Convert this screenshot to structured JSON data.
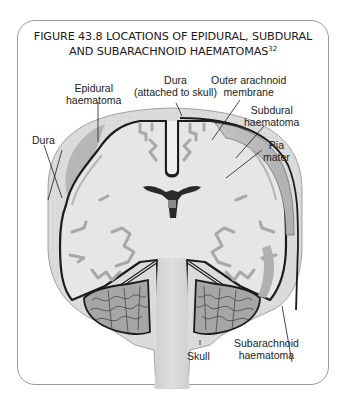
{
  "figure": {
    "title_line1": "FIGURE 43.8 LOCATIONS OF EPIDURAL, SUBDURAL",
    "title_line2": "AND SUBARACHNOID HAEMATOMAS",
    "title_reference": "32"
  },
  "diagram": {
    "labels": [
      {
        "id": "epidural-haematoma",
        "line1": "Epidural",
        "line2": "haematoma"
      },
      {
        "id": "dura-attached",
        "line1": "Dura",
        "line2": "(attached to skull)"
      },
      {
        "id": "outer-arachnoid",
        "line1": "Outer arachnoid",
        "line2": "membrane"
      },
      {
        "id": "dura",
        "line1": "Dura",
        "line2": ""
      },
      {
        "id": "subdural-haematoma",
        "line1": "Subdural",
        "line2": "haematoma"
      },
      {
        "id": "pia-mater",
        "line1": "Pia",
        "line2": "mater"
      },
      {
        "id": "subarachnoid-haematoma",
        "line1": "Subarachnoid",
        "line2": "haematoma"
      },
      {
        "id": "skull",
        "line1": "Skull",
        "line2": ""
      }
    ],
    "colors": {
      "skull": "#d9d9d9",
      "brain": "#e8e8e8",
      "haematoma": "#bdbdbd",
      "dura_line": "#1c1c1c",
      "sulci": "#a9a9a9",
      "cerebellum": "#9e9e9e",
      "frame": "#9a9a9a"
    }
  }
}
